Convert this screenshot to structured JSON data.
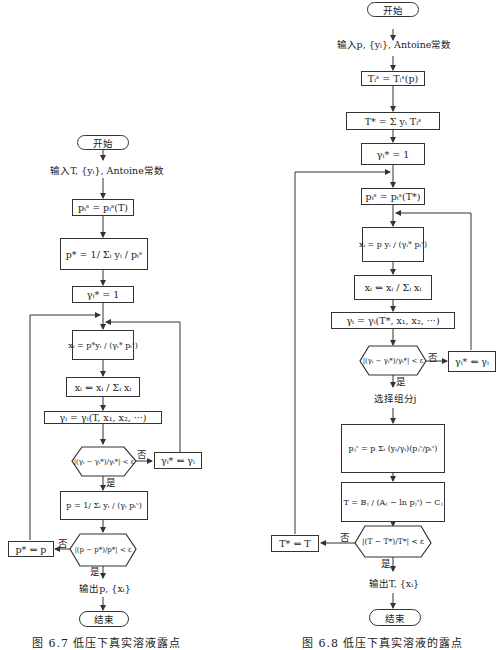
{
  "left_flowchart": {
    "caption": "图 6.7  低压下真实溶液露点",
    "nodes": {
      "start": "开始",
      "input": "输入T, {yᵢ}, Antoine常数",
      "psat": "pᵢˢ = pᵢˢ(T)",
      "pstar": "p* = 1/ Σᵢ yᵢ / pᵢˢ",
      "gamma_init": "γᵢ* = 1",
      "x_calc": "xᵢ = p*yᵢ / (γᵢ* pᵢˢ)",
      "x_norm": "xᵢ ⇐ xᵢ / Σᵢ xᵢ",
      "gamma_calc": "γᵢ = γᵢ(T, x₁, x₂, ···)",
      "gamma_check": "|(γᵢ − γᵢ*)/γᵢ*| < ε",
      "gamma_update": "γᵢ* ⇐ γᵢ",
      "p_calc": "p = 1/ Σᵢ yᵢ / (γᵢ pᵢˢ)",
      "p_check": "|(p − p*)/p*| < ε",
      "p_update": "p* ⇐ p",
      "output": "输出p, {xᵢ}",
      "end": "结束"
    },
    "labels": {
      "no1": "否",
      "yes1": "是",
      "no2": "否",
      "yes2": "是"
    }
  },
  "right_flowchart": {
    "caption": "图 6.8  低压下真实溶液的露点",
    "nodes": {
      "start": "开始",
      "input": "输入p, {yᵢ}, Antoine常数",
      "tsat": "Tᵢˢ = Tᵢˢ(p)",
      "tstar": "T* = Σ yᵢ Tᵢˢ",
      "gamma_init": "γᵢ* = 1",
      "psat": "pᵢˢ = pᵢˢ(T*)",
      "x_calc": "xᵢ = p yᵢ / (γᵢ* pᵢˢ)",
      "x_norm": "xᵢ ⇐ xᵢ / Σᵢ xᵢ",
      "gamma_calc": "γᵢ = γᵢ(T*, x₁, x₂, ···)",
      "gamma_check": "|(γᵢ − γᵢ*)/γᵢ*| < ε",
      "gamma_update": "γᵢ* ⇐ γᵢ",
      "select": "选择组分j",
      "pj_calc": "pⱼˢ = p Σᵢ (yᵢ/γᵢ)(pⱼˢ/pᵢˢ)",
      "t_calc": "T = Bⱼ / (Aⱼ − ln pⱼˢ) − Cⱼ",
      "t_check": "|(T − T*)/T*| < ε",
      "t_update": "T* ⇐ T",
      "output": "输出T, {xᵢ}",
      "end": "结束"
    },
    "labels": {
      "no1": "否",
      "yes1": "是",
      "no2": "否",
      "yes2": "是"
    }
  }
}
